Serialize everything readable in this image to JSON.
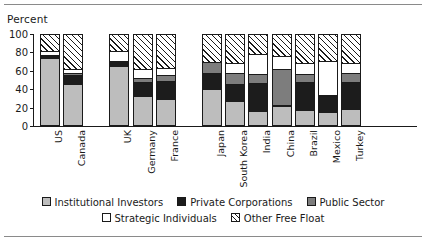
{
  "figure": {
    "y_axis_title": "Percent"
  },
  "legend": {
    "row1": [
      {
        "key": "institutional",
        "label": "Institutional Investors",
        "color": "#bdbdbd",
        "swatch": "solid"
      },
      {
        "key": "private",
        "label": "Private Corporations",
        "color": "#1c1c1c",
        "swatch": "solid"
      },
      {
        "key": "public",
        "label": "Public Sector",
        "color": "#7d7d7d",
        "swatch": "solid"
      }
    ],
    "row2": [
      {
        "key": "strategic",
        "label": "Strategic Individuals",
        "color": "#ffffff",
        "swatch": "solid"
      },
      {
        "key": "freefloat",
        "label": "Other Free Float",
        "color": "#ffffff",
        "swatch": "hatch"
      }
    ]
  },
  "chart_data": {
    "type": "bar",
    "stacked": true,
    "title": "",
    "xlabel": "",
    "ylabel": "Percent",
    "ylim": [
      0,
      100
    ],
    "yticks": [
      0,
      20,
      40,
      60,
      80,
      100
    ],
    "grid": false,
    "legend_position": "bottom",
    "categories": [
      "US",
      "Canada",
      "UK",
      "Germany",
      "France",
      "Japan",
      "South Korea",
      "India",
      "China",
      "Brazil",
      "Mexico",
      "Turkey"
    ],
    "group_breaks_after": [
      "Canada",
      "France"
    ],
    "series": [
      {
        "name": "Institutional Investors",
        "color": "#bdbdbd",
        "values": [
          72,
          44,
          63,
          30,
          27,
          38,
          25,
          14,
          20,
          15,
          13,
          16
        ]
      },
      {
        "name": "Private Corporations",
        "color": "#1c1c1c",
        "values": [
          4,
          10,
          7,
          17,
          21,
          19,
          20,
          32,
          2,
          32,
          19,
          31
        ]
      },
      {
        "name": "Public Sector",
        "color": "#7d7d7d",
        "values": [
          0,
          3,
          0,
          4,
          6,
          11,
          12,
          10,
          39,
          8,
          1,
          10
        ]
      },
      {
        "name": "Strategic Individuals",
        "color": "#ffffff",
        "values": [
          4,
          4,
          10,
          10,
          8,
          1,
          10,
          21,
          14,
          12,
          37,
          10
        ]
      },
      {
        "name": "Other Free Float",
        "color": "hatch",
        "values": [
          20,
          39,
          20,
          39,
          38,
          31,
          33,
          23,
          25,
          33,
          30,
          33
        ]
      }
    ]
  }
}
